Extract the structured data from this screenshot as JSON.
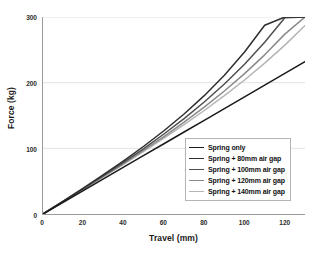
{
  "chart_data": {
    "type": "line",
    "title": "",
    "xlabel": "Travel (mm)",
    "ylabel": "Force (kg)",
    "xlim": [
      0,
      130
    ],
    "ylim": [
      0,
      300
    ],
    "xticks": [
      0,
      20,
      40,
      60,
      80,
      100,
      120
    ],
    "yticks": [
      0,
      100,
      200,
      300
    ],
    "grid": "horizontal",
    "legend_position": "lower-right-inside",
    "x": [
      0,
      10,
      20,
      30,
      40,
      50,
      60,
      70,
      80,
      90,
      100,
      110,
      120,
      130
    ],
    "series": [
      {
        "name": "Spring only",
        "color": "#1a1a1a",
        "values": [
          0,
          17.8,
          35.7,
          53.5,
          71.4,
          89.2,
          107.0,
          124.9,
          142.7,
          160.6,
          178.4,
          196.2,
          214.1,
          232.0
        ]
      },
      {
        "name": "Spring + 80mm air gap",
        "color": "#2e2e2e",
        "values": [
          0,
          19.5,
          39.4,
          59.8,
          81.0,
          103.2,
          126.8,
          152.3,
          180.2,
          211.3,
          246.6,
          287.5,
          300.0,
          300.0
        ]
      },
      {
        "name": "Spring + 100mm air gap",
        "color": "#4f4f4f",
        "values": [
          0,
          19.1,
          38.5,
          58.3,
          78.6,
          99.7,
          121.8,
          145.3,
          170.5,
          197.9,
          228.0,
          261.5,
          299.0,
          300.0
        ]
      },
      {
        "name": "Spring + 120mm air gap",
        "color": "#8a8a8a",
        "values": [
          0,
          18.8,
          37.9,
          57.2,
          76.9,
          97.1,
          118.0,
          139.8,
          162.8,
          187.3,
          213.7,
          242.4,
          273.9,
          300.0
        ]
      },
      {
        "name": "Spring + 140mm air gap",
        "color": "#b5b5b5",
        "values": [
          0,
          18.6,
          37.4,
          56.4,
          75.7,
          95.3,
          115.4,
          136.1,
          157.6,
          180.2,
          204.1,
          229.7,
          257.2,
          287.0
        ]
      }
    ]
  },
  "legend": {
    "entries": [
      {
        "label": "Spring only"
      },
      {
        "label": "Spring + 80mm air gap"
      },
      {
        "label": "Spring + 100mm air gap"
      },
      {
        "label": "Spring + 120mm air gap"
      },
      {
        "label": "Spring + 140mm air gap"
      }
    ]
  },
  "style": {
    "axis_color": "#9a9a9a",
    "grid_color": "#e2e2e2",
    "text_color": "#1a1a1a",
    "background": "#ffffff"
  }
}
